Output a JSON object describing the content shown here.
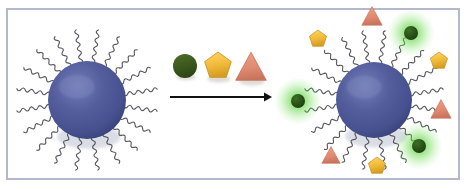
{
  "figure": {
    "title": "Polymer-coated nanoparticle functionalization schematic",
    "frame_color": "#b3b8cc",
    "background_color": "#ffffff",
    "width": 468,
    "height": 190
  },
  "legend": {
    "items": [
      {
        "name": "green-circle-ligand",
        "shape": "circle",
        "color": "#3f5a1f",
        "label": "",
        "cx": 185,
        "cy": 66,
        "r": 12
      },
      {
        "name": "yellow-pentagon-ligand",
        "shape": "pentagon",
        "color": "#f0bc3c",
        "label": "",
        "cx": 218,
        "cy": 66,
        "r": 14
      },
      {
        "name": "salmon-triangle-ligand",
        "shape": "triangle",
        "color": "#e08b72",
        "label": "",
        "cx": 251,
        "cy": 68,
        "r": 15
      }
    ]
  },
  "arrow": {
    "name": "reaction-arrow",
    "color": "#111111",
    "x1": 170,
    "y1": 97,
    "x2": 272,
    "y2": 97,
    "label": ""
  },
  "reactant_particle": {
    "name": "bare-polymer-coated-nanoparticle",
    "core_color": "#4e5894",
    "core_highlight": "#6e78ad",
    "core_shadow": "#3c4679",
    "chain_color": "#4a4a52",
    "cx": 87,
    "cy": 100,
    "r": 39,
    "chain_count": 20,
    "chain_length": 34,
    "terminal_ligands": []
  },
  "product_particle": {
    "name": "functionalized-nanoparticle",
    "core_color": "#4e5894",
    "core_highlight": "#6e78ad",
    "core_shadow": "#3c4679",
    "chain_color": "#4a4a52",
    "cx": 374,
    "cy": 100,
    "r": 38,
    "chain_count": 20,
    "chain_length": 34,
    "glow_color": "#4fbf3f",
    "terminal_ligands": [
      {
        "shape": "triangle",
        "color": "#e08b72",
        "x": 372,
        "y": 17,
        "r": 10,
        "glow": false,
        "name": "ligand-triangle-top"
      },
      {
        "shape": "circle",
        "color": "#2f5a1f",
        "x": 411,
        "y": 33,
        "r": 7,
        "glow": true,
        "name": "ligand-circle-upper-right"
      },
      {
        "shape": "pentagon",
        "color": "#f0bc3c",
        "x": 318,
        "y": 39,
        "r": 9,
        "glow": false,
        "name": "ligand-pentagon-upper-left"
      },
      {
        "shape": "pentagon",
        "color": "#f0bc3c",
        "x": 439,
        "y": 61,
        "r": 9,
        "glow": false,
        "name": "ligand-pentagon-right"
      },
      {
        "shape": "circle",
        "color": "#2f5a1f",
        "x": 298,
        "y": 101,
        "r": 7,
        "glow": true,
        "name": "ligand-circle-left"
      },
      {
        "shape": "triangle",
        "color": "#e08b72",
        "x": 441,
        "y": 110,
        "r": 10,
        "glow": false,
        "name": "ligand-triangle-right"
      },
      {
        "shape": "circle",
        "color": "#2f5a1f",
        "x": 419,
        "y": 146,
        "r": 7,
        "glow": true,
        "name": "ligand-circle-lower-right"
      },
      {
        "shape": "triangle",
        "color": "#e08b72",
        "x": 331,
        "y": 156,
        "r": 9,
        "glow": false,
        "name": "ligand-triangle-lower-left"
      },
      {
        "shape": "pentagon",
        "color": "#f0bc3c",
        "x": 377,
        "y": 166,
        "r": 9,
        "glow": false,
        "name": "ligand-pentagon-bottom"
      }
    ]
  }
}
